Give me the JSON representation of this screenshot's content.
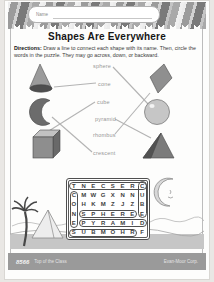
{
  "page": {
    "name_label": "Name",
    "title": "Shapes Are Everywhere",
    "directions_bold": "Directions:",
    "directions_text": " Draw a line to connect each shape with its name. Then, circle the words in the puzzle. They may go across, down, or backward."
  },
  "matching": {
    "labels": [
      {
        "id": "sphere",
        "text": "sphere"
      },
      {
        "id": "cone",
        "text": "cone"
      },
      {
        "id": "cube",
        "text": "cube"
      },
      {
        "id": "pyramid",
        "text": "pyramid"
      },
      {
        "id": "rhombus",
        "text": "rhombus"
      },
      {
        "id": "crescent",
        "text": "crescent"
      }
    ],
    "left_shapes": [
      "cone",
      "crescent",
      "cube"
    ],
    "right_shapes": [
      "rhombus",
      "sphere",
      "pyramid"
    ],
    "connections": [
      {
        "shape": "cone",
        "label": "cone"
      },
      {
        "shape": "sphere",
        "label": "sphere"
      },
      {
        "shape": "cube",
        "label": "cube"
      },
      {
        "shape": "crescent",
        "label": "crescent"
      },
      {
        "shape": "pyramid",
        "label": "pyramid"
      },
      {
        "shape": "rhombus",
        "label": "rhombus"
      }
    ]
  },
  "puzzle": {
    "rows": [
      "TNECSERC",
      "CMWGXNNU",
      "OHKMZJZB",
      "NSPHEREE",
      "EPYRAMID",
      "SUBMOHRF"
    ],
    "found_words": [
      {
        "word": "CRESCENT",
        "row": 0,
        "col": 0,
        "dir": "h",
        "len": 8
      },
      {
        "word": "CUBE",
        "row": 0,
        "col": 7,
        "dir": "v",
        "len": 4
      },
      {
        "word": "CONE",
        "row": 1,
        "col": 0,
        "dir": "v",
        "len": 4
      },
      {
        "word": "SPHERE",
        "row": 3,
        "col": 1,
        "dir": "h",
        "len": 6
      },
      {
        "word": "PYRAMID",
        "row": 4,
        "col": 1,
        "dir": "h",
        "len": 7
      },
      {
        "word": "RHOMBUS",
        "row": 5,
        "col": 0,
        "dir": "h",
        "len": 7
      }
    ]
  },
  "footer": {
    "left_code": "8566",
    "left_text": "Top of the Class",
    "right_text": "Evan-Moor Corp."
  },
  "colors": {
    "footer_bar": "#9a9a9a",
    "stripe_dark": "#7a7a7a",
    "stripe_light": "#d2d2d2",
    "line_gray": "#b3b3b3"
  }
}
